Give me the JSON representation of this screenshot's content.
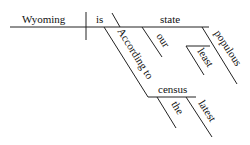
{
  "diagram": {
    "type": "sentence-diagram",
    "words": {
      "subject": "Wyoming",
      "verb": "is",
      "complement": "state",
      "modifier_our": "our",
      "modifier_populous": "populous",
      "modifier_least": "least",
      "preposition": "According to",
      "object": "census",
      "modifier_the": "the",
      "modifier_latest": "latest"
    }
  }
}
